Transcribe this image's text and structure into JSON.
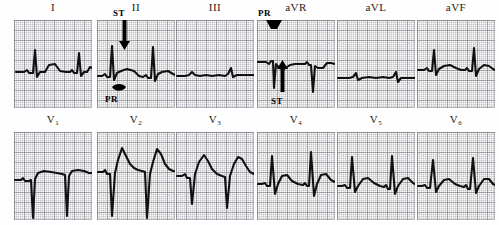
{
  "figure": {
    "kind": "12-lead-ecg",
    "layout": {
      "rows": 2,
      "cols": 6,
      "panel_width_px": 78,
      "panel_height_px": 88
    },
    "grid": {
      "small_square_px": 2,
      "large_square_px": 10,
      "minor_color": "#96969f",
      "major_color": "#78787f",
      "paper_color": "#fdfdfd"
    },
    "trace_color": "#111111"
  },
  "leads": [
    {
      "id": "I",
      "label": "I",
      "sub": "",
      "row": 0,
      "col": 0,
      "path": "M2,52 L10,52 L13,50 L15,53 L19,53 L21,30 L23,57 L26,52 L31,52 L35,45 L41,44 L46,51 L52,52 L56,52 L58,50 L60,53 L63,53 L65,33 L67,56 L70,52 L73,52 L76,47 L78,48"
    },
    {
      "id": "II",
      "label": "II",
      "sub": "",
      "row": 0,
      "col": 1,
      "path": "M1,56 L5,56 L8,54 L10,57 L13,57 L15,26 L17,60 L20,53 L24,51 L30,49 L37,51 L42,56 L46,57 L49,55 L51,58 L54,58 L56,27 L58,61 L61,54 L65,52 L71,51 L76,54 L78,55"
    },
    {
      "id": "III",
      "label": "III",
      "sub": "",
      "row": 0,
      "col": 2,
      "path": "M1,56 L9,56 L13,55 L16,52 L19,55 L24,56 L30,55 L36,56 L43,55 L49,56 L52,54 L55,48 L57,57 L61,55 L67,55 L73,55 L78,55"
    },
    {
      "id": "aVR",
      "label": "aVR",
      "sub": "",
      "row": 0,
      "col": 3,
      "path": "M1,42 L9,42 L12,44 L14,41 L16,41 L17,68 L19,44 L22,48 L27,49 L33,45 L38,44 L44,44 L48,44 L50,42 L52,45 L54,45 L56,72 L58,46 L61,48 L66,48 L70,43 L74,43 L78,44"
    },
    {
      "id": "aVL",
      "label": "aVL",
      "sub": "",
      "row": 0,
      "col": 4,
      "path": "M1,58 L12,58 L16,57 L19,53 L21,60 L25,58 L32,57 L39,58 L46,57 L52,58 L56,57 L59,52 L61,62 L64,58 L70,58 L75,58 L78,58"
    },
    {
      "id": "aVF",
      "label": "aVF",
      "sub": "",
      "row": 0,
      "col": 5,
      "path": "M1,50 L7,50 L10,48 L12,51 L15,51 L17,30 L19,55 L22,49 L27,46 L33,45 L39,48 L44,50 L48,50 L50,48 L52,51 L55,51 L57,28 L59,56 L62,49 L67,45 L72,46 L76,49 L78,50"
    },
    {
      "id": "V1",
      "label": "V",
      "sub": "1",
      "row": 1,
      "col": 0,
      "path": "M1,48 L7,48 L9,46 L11,49 L15,49 L17,48 L19,86 L21,47 L24,41 L30,39 L37,40 L43,41 L48,42 L51,43 L53,84 L55,44 L58,39 L64,38 L70,39 L75,41 L78,41"
    },
    {
      "id": "V2",
      "label": "V",
      "sub": "2",
      "row": 1,
      "col": 1,
      "path": "M1,40 L6,40 L8,38 L10,42 L13,42 L15,84 L18,41 L21,28 L25,16 L29,24 L33,32 L37,36 L41,38 L45,39 L48,40 L50,86 L53,42 L56,30 L60,17 L64,22 L68,32 L72,37 L76,39 L78,39"
    },
    {
      "id": "V3",
      "label": "V",
      "sub": "3",
      "row": 1,
      "col": 2,
      "path": "M1,44 L6,44 L9,42 L11,46 L14,46 L16,72 L19,42 L23,30 L28,23 L32,29 L36,37 L41,42 L46,44 L49,45 L51,76 L54,44 L58,32 L62,25 L66,27 L70,34 L74,40 L78,42"
    },
    {
      "id": "V4",
      "label": "V",
      "sub": "4",
      "row": 1,
      "col": 3,
      "path": "M1,52 L5,52 L8,51 L10,54 L13,54 L15,24 L18,62 L21,52 L25,44 L30,43 L35,49 L41,52 L46,53 L48,51 L50,54 L52,54 L54,20 L57,64 L60,52 L64,43 L69,42 L74,48 L78,50"
    },
    {
      "id": "V5",
      "label": "V",
      "sub": "5",
      "row": 1,
      "col": 4,
      "path": "M1,54 L5,54 L8,53 L10,56 L13,56 L15,25 L18,60 L21,54 L26,47 L31,46 L37,51 L43,54 L47,55 L49,53 L51,57 L53,57 L55,24 L58,62 L61,54 L66,47 L71,46 L76,51 L78,52"
    },
    {
      "id": "V6",
      "label": "V",
      "sub": "6",
      "row": 1,
      "col": 5,
      "path": "M1,54 L5,54 L8,53 L10,56 L13,56 L16,28 L19,60 L22,54 L27,48 L32,47 L38,52 L43,54 L47,55 L49,53 L51,57 L53,57 L56,26 L59,61 L62,54 L67,47 L72,47 L76,52 L78,53"
    }
  ],
  "annotations": [
    {
      "id": "ii-st",
      "lead": "II",
      "text": "ST",
      "text_x": 16,
      "text_y": -12,
      "arrow": "down",
      "arrow_x": 22,
      "arrow_y": 0,
      "arrow_len": 30
    },
    {
      "id": "ii-pr",
      "lead": "II",
      "text": "PR",
      "text_x": 8,
      "text_y": 74,
      "arrow": "blob",
      "arrow_x": 14,
      "arrow_y": 64,
      "arrow_len": 0
    },
    {
      "id": "avr-pr",
      "lead": "aVR",
      "text": "PR",
      "text_x": 1,
      "text_y": -12,
      "arrow": "blob-down",
      "arrow_x": 9,
      "arrow_y": 0,
      "arrow_len": 0
    },
    {
      "id": "avr-st",
      "lead": "aVR",
      "text": "ST",
      "text_x": 14,
      "text_y": 76,
      "arrow": "up",
      "arrow_x": 20,
      "arrow_y": 40,
      "arrow_len": 32
    }
  ]
}
